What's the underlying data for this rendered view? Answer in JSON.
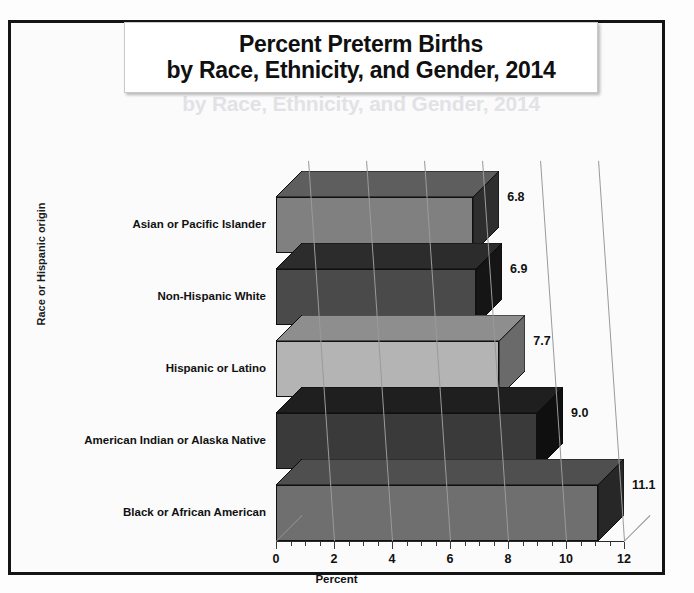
{
  "title": {
    "line1": "Percent Preterm Births",
    "line2": "by Race, Ethnicity, and Gender, 2014",
    "ghost_line": "by Race, Ethnicity, and Gender, 2014"
  },
  "chart_data": {
    "type": "bar",
    "orientation": "horizontal",
    "style": "3d",
    "title": "Percent Preterm Births by Race, Ethnicity, and Gender, 2014",
    "xlabel": "Percent",
    "ylabel": "Race or Hispanic origin",
    "xlim": [
      0,
      12
    ],
    "xticks": [
      0,
      2,
      4,
      6,
      8,
      10,
      12
    ],
    "xtick_labels": [
      "0",
      "2",
      "4",
      "6",
      "8",
      "10",
      "12"
    ],
    "minor_tick_interval": 0.5,
    "grid": true,
    "gridlines_at": [
      2,
      4,
      6,
      8,
      10,
      12
    ],
    "legend": "none",
    "categories": [
      "Asian or Pacific Islander",
      "Non-Hispanic White",
      "Hispanic or Latino",
      "American Indian or Alaska Native",
      "Black or African American"
    ],
    "values": [
      6.8,
      6.9,
      7.7,
      9.0,
      11.1
    ],
    "value_labels": [
      "6.8",
      "6.9",
      "7.7",
      "9.0",
      "11.1"
    ],
    "bar_colors": [
      "#808080",
      "#4a4a4a",
      "#b4b4b4",
      "#3a3a3a",
      "#6f6f6f"
    ],
    "bar_top_colors": [
      "#5e5e5e",
      "#2c2c2c",
      "#8e8e8e",
      "#1f1f1f",
      "#4f4f4f"
    ],
    "bar_side_colors": [
      "#2e2e2e",
      "#151515",
      "#6a6a6a",
      "#0f0f0f",
      "#272727"
    ]
  }
}
